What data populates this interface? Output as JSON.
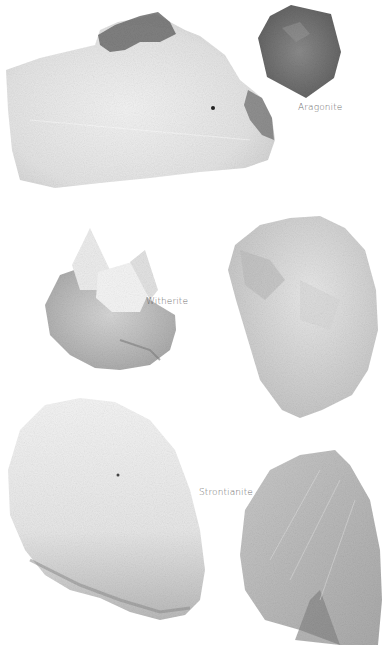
{
  "image": {
    "description": "Grayscale photographs of mineral specimens on white background",
    "background_color": "#ffffff"
  },
  "specimens": [
    {
      "id": "large-white-top-left",
      "label": null
    },
    {
      "id": "aragonite-hexagon",
      "label": "Aragonite"
    },
    {
      "id": "witherite-cluster",
      "label": "Witherite"
    },
    {
      "id": "crystal-mass-right",
      "label": null
    },
    {
      "id": "strontianite-white-mass",
      "label": "Strontianite"
    },
    {
      "id": "fibrous-crystal-bottom-right",
      "label": null
    }
  ],
  "labels": {
    "aragonite": "Aragonite",
    "witherite": "Witherite",
    "strontianite": "Strontianite"
  },
  "colors": {
    "label_text": "#6f6f6f",
    "light_mineral": "#e4e4e4",
    "mid_mineral": "#c9c9c9",
    "dark_mineral": "#6a6a6a"
  }
}
